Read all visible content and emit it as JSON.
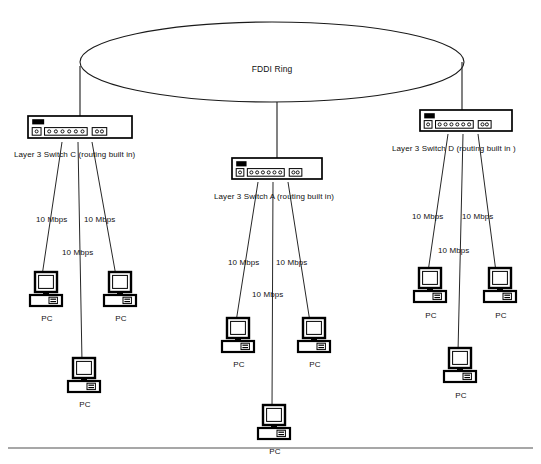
{
  "diagram": {
    "ring": {
      "label": "FDDI Ring",
      "cx": 272,
      "cy": 62,
      "rx": 192,
      "ry": 40
    },
    "colors": {
      "line": "#1a1a1a",
      "text": "#111111",
      "background": "#ffffff",
      "footer_rule": "#8a8a8a",
      "switch_body": "#ffffff",
      "switch_led": "#000000",
      "pc_body": "#ffffff",
      "pc_outline": "#000000"
    },
    "switches": [
      {
        "id": "switch-c",
        "label": "Layer 3 Switch C (routing built in)",
        "x": 28,
        "y": 116,
        "w": 104,
        "h": 22,
        "label_x": 14,
        "label_y": 150,
        "uplink_x": 80,
        "uplink_top_y": 66
      },
      {
        "id": "switch-a",
        "label": "Layer 3 Switch A (routing built in)",
        "x": 232,
        "y": 158,
        "w": 90,
        "h": 21,
        "label_x": 214,
        "label_y": 192,
        "uplink_x": 277,
        "uplink_top_y": 102
      },
      {
        "id": "switch-d",
        "label": "Layer 3 Switch  D (routing built in )",
        "x": 420,
        "y": 110,
        "w": 92,
        "h": 21,
        "label_x": 392,
        "label_y": 144,
        "uplink_x": 462,
        "uplink_top_y": 62
      }
    ],
    "speed_labels": [
      {
        "text": "10 Mbps",
        "x": 36,
        "y": 215
      },
      {
        "text": "10 Mbps",
        "x": 84,
        "y": 215
      },
      {
        "text": "10 Mbps",
        "x": 62,
        "y": 248
      },
      {
        "text": "10 Mbps",
        "x": 228,
        "y": 258
      },
      {
        "text": "10 Mbps",
        "x": 276,
        "y": 258
      },
      {
        "text": "10 Mbps",
        "x": 252,
        "y": 290
      },
      {
        "text": "10 Mbps",
        "x": 412,
        "y": 212
      },
      {
        "text": "10 Mbps",
        "x": 462,
        "y": 212
      },
      {
        "text": "10 Mbps",
        "x": 438,
        "y": 246
      }
    ],
    "pcs": [
      {
        "id": "pc-c-1",
        "label": "PC",
        "x": 30,
        "y": 272,
        "label_x": 47,
        "label_y": 314
      },
      {
        "id": "pc-c-2",
        "label": "PC",
        "x": 104,
        "y": 272,
        "label_x": 121,
        "label_y": 314
      },
      {
        "id": "pc-c-3",
        "label": "PC",
        "x": 68,
        "y": 358,
        "label_x": 85,
        "label_y": 400
      },
      {
        "id": "pc-a-1",
        "label": "PC",
        "x": 222,
        "y": 318,
        "label_x": 239,
        "label_y": 360
      },
      {
        "id": "pc-a-2",
        "label": "PC",
        "x": 298,
        "y": 318,
        "label_x": 315,
        "label_y": 360
      },
      {
        "id": "pc-a-3",
        "label": "PC",
        "x": 258,
        "y": 405,
        "label_x": 275,
        "label_y": 447
      },
      {
        "id": "pc-d-1",
        "label": "PC",
        "x": 414,
        "y": 268,
        "label_x": 431,
        "label_y": 311
      },
      {
        "id": "pc-d-2",
        "label": "PC",
        "x": 484,
        "y": 268,
        "label_x": 501,
        "label_y": 311
      },
      {
        "id": "pc-d-3",
        "label": "PC",
        "x": 444,
        "y": 348,
        "label_x": 461,
        "label_y": 391
      }
    ],
    "links": [
      {
        "from": "switch-c",
        "to": "pc-c-1",
        "x1": 62,
        "y1": 142,
        "x2": 42,
        "y2": 276
      },
      {
        "from": "switch-c",
        "to": "pc-c-2",
        "x1": 92,
        "y1": 142,
        "x2": 116,
        "y2": 276
      },
      {
        "from": "switch-c",
        "to": "pc-c-3",
        "x1": 78,
        "y1": 142,
        "x2": 82,
        "y2": 362
      },
      {
        "from": "switch-a",
        "to": "pc-a-1",
        "x1": 258,
        "y1": 182,
        "x2": 236,
        "y2": 322
      },
      {
        "from": "switch-a",
        "to": "pc-a-2",
        "x1": 288,
        "y1": 182,
        "x2": 310,
        "y2": 322
      },
      {
        "from": "switch-a",
        "to": "pc-a-3",
        "x1": 273,
        "y1": 182,
        "x2": 272,
        "y2": 409
      },
      {
        "from": "switch-d",
        "to": "pc-d-1",
        "x1": 448,
        "y1": 134,
        "x2": 428,
        "y2": 272
      },
      {
        "from": "switch-d",
        "to": "pc-d-2",
        "x1": 478,
        "y1": 134,
        "x2": 496,
        "y2": 272
      },
      {
        "from": "switch-d",
        "to": "pc-d-3",
        "x1": 463,
        "y1": 134,
        "x2": 458,
        "y2": 352
      }
    ],
    "footer_rule": {
      "x1": 8,
      "x2": 533,
      "y": 448
    }
  }
}
